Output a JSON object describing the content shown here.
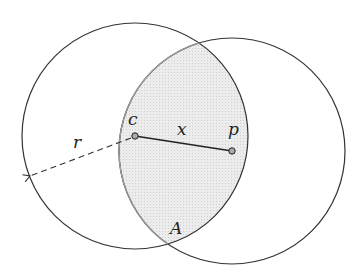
{
  "diagram": {
    "title": "",
    "labels": {
      "c": "c",
      "p": "p",
      "x": "x",
      "r": "r",
      "A": "A"
    },
    "circles": [
      {
        "name": "circle-c",
        "cx": 135,
        "cy": 136,
        "r": 113
      },
      {
        "name": "circle-p",
        "cx": 232,
        "cy": 151,
        "r": 113
      }
    ],
    "points": [
      {
        "name": "c",
        "x": 135,
        "y": 136
      },
      {
        "name": "p",
        "x": 232,
        "y": 151
      }
    ],
    "segments": [
      {
        "name": "x",
        "from": "c",
        "to": "p",
        "style": "solid"
      },
      {
        "name": "r",
        "from": "c",
        "to": [
          30,
          176
        ],
        "style": "dashed-arrow"
      }
    ],
    "regions": [
      {
        "name": "A",
        "description": "intersection (lens) of the two circles",
        "fill": "#e6e6e6"
      }
    ],
    "colors": {
      "stroke": "#333333",
      "lens_fill": "#e8e8e8",
      "lens_stroke": "#888888"
    }
  }
}
